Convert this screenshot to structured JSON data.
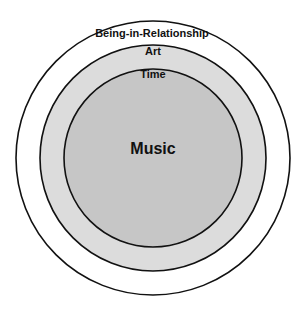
{
  "diagram": {
    "type": "nested-circles",
    "circles": [
      {
        "id": "being-in-relationship",
        "label": "Being-in-Relationship",
        "fill": "#ffffff"
      },
      {
        "id": "art",
        "label": "Art",
        "fill": "#dcdcdc"
      },
      {
        "id": "time",
        "label": "Time",
        "fill": "#c6c6c6"
      }
    ],
    "center_label": "Music",
    "stroke_color": "#111111"
  }
}
